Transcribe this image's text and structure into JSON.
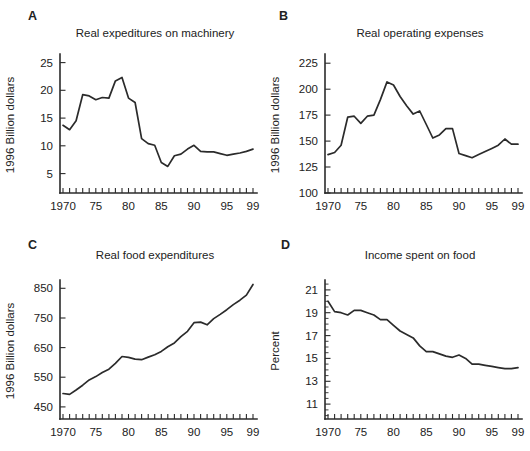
{
  "figure": {
    "background": "#ffffff",
    "line_color": "#2b2b2b",
    "text_color": "#222222"
  },
  "chart_data": {
    "type": "line",
    "layout": "2x2-panel-multiples",
    "years": [
      1970,
      1971,
      1972,
      1973,
      1974,
      1975,
      1976,
      1977,
      1978,
      1979,
      1980,
      1981,
      1982,
      1983,
      1984,
      1985,
      1986,
      1987,
      1988,
      1989,
      1990,
      1991,
      1992,
      1993,
      1994,
      1995,
      1996,
      1997,
      1998,
      1999
    ],
    "xticks": [
      [
        1970,
        "1970"
      ],
      [
        1975,
        "75"
      ],
      [
        1980,
        "80"
      ],
      [
        1985,
        "85"
      ],
      [
        1990,
        "90"
      ],
      [
        1995,
        "95"
      ],
      [
        1999,
        "99"
      ]
    ],
    "panels": [
      {
        "letter": "A",
        "title": "Real expeditures on machinery",
        "ylabel": "1996 Billion dollars",
        "yticks": [
          5,
          10,
          15,
          20,
          25
        ],
        "ylim": [
          1.5,
          26
        ],
        "values": [
          13.7,
          12.9,
          14.5,
          19.2,
          19.0,
          18.3,
          18.7,
          18.6,
          21.7,
          22.3,
          18.6,
          17.8,
          11.3,
          10.4,
          10.1,
          7.0,
          6.3,
          8.2,
          8.5,
          9.4,
          10.1,
          9.0,
          8.9,
          8.9,
          8.6,
          8.3,
          8.5,
          8.7,
          9.0,
          9.4
        ]
      },
      {
        "letter": "B",
        "title": "Real operating expenses",
        "ylabel": "1996 Billion dollars",
        "yticks": [
          100,
          125,
          150,
          175,
          200,
          225
        ],
        "ylim": [
          100,
          231
        ],
        "values": [
          137,
          139,
          146,
          173,
          174,
          167,
          174,
          175,
          190,
          207,
          204,
          193,
          184,
          176,
          179,
          166,
          153,
          156,
          162,
          162,
          138,
          136,
          134,
          137,
          140,
          143,
          146,
          152,
          147,
          147
        ]
      },
      {
        "letter": "C",
        "title": "Real food expenditures",
        "ylabel": "1996 Billion dollars",
        "yticks": [
          450,
          550,
          650,
          750,
          850
        ],
        "ylim": [
          409,
          868
        ],
        "values": [
          495,
          492,
          507,
          523,
          541,
          552,
          566,
          577,
          597,
          620,
          617,
          611,
          609,
          618,
          626,
          637,
          653,
          666,
          687,
          705,
          734,
          736,
          727,
          748,
          762,
          778,
          795,
          810,
          827,
          863
        ]
      },
      {
        "letter": "D",
        "title": "Income spent on food",
        "ylabel": "Percent",
        "yticks": [
          11,
          13,
          15,
          17,
          19,
          21
        ],
        "minor_ytick_step": 0.5,
        "ylim": [
          9.7,
          21.6
        ],
        "values": [
          20.0,
          19.1,
          19.0,
          18.8,
          19.2,
          19.2,
          19.0,
          18.8,
          18.4,
          18.4,
          17.9,
          17.4,
          17.1,
          16.8,
          16.1,
          15.6,
          15.6,
          15.4,
          15.2,
          15.1,
          15.3,
          15.0,
          14.5,
          14.5,
          14.4,
          14.3,
          14.2,
          14.1,
          14.1,
          14.2
        ]
      }
    ]
  }
}
